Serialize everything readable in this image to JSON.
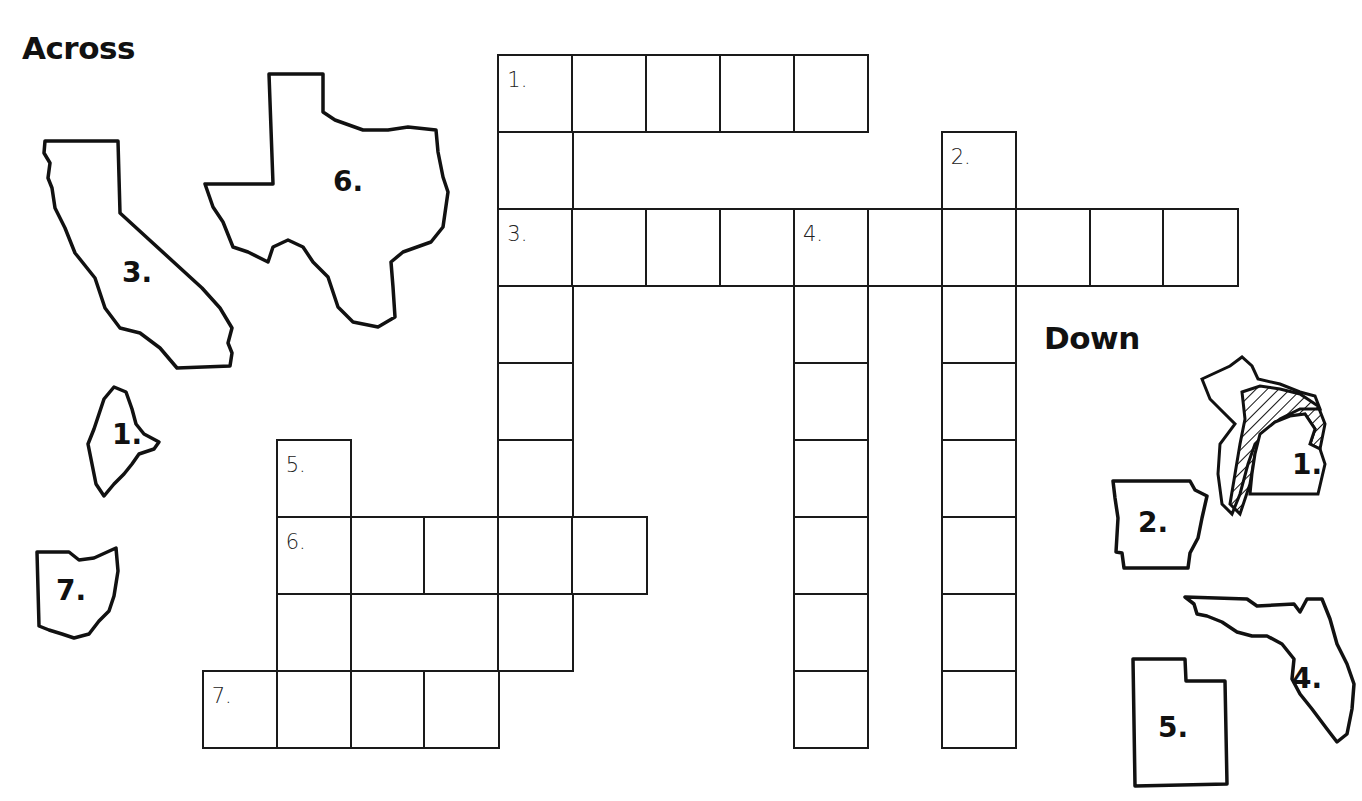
{
  "headings": {
    "across": "Across",
    "down": "Down"
  },
  "grid": {
    "origin_x": 203,
    "origin_y": 55,
    "cell_w": 73.9,
    "cell_h": 77.0,
    "cells": [
      [
        0,
        4,
        "1."
      ],
      [
        0,
        5,
        ""
      ],
      [
        0,
        6,
        ""
      ],
      [
        0,
        7,
        ""
      ],
      [
        0,
        8,
        ""
      ],
      [
        1,
        4,
        ""
      ],
      [
        1,
        10,
        "2."
      ],
      [
        2,
        4,
        "3."
      ],
      [
        2,
        5,
        ""
      ],
      [
        2,
        6,
        ""
      ],
      [
        2,
        7,
        ""
      ],
      [
        2,
        8,
        "4."
      ],
      [
        2,
        9,
        ""
      ],
      [
        2,
        10,
        ""
      ],
      [
        2,
        11,
        ""
      ],
      [
        2,
        12,
        ""
      ],
      [
        2,
        13,
        ""
      ],
      [
        3,
        4,
        ""
      ],
      [
        3,
        8,
        ""
      ],
      [
        3,
        10,
        ""
      ],
      [
        4,
        4,
        ""
      ],
      [
        4,
        8,
        ""
      ],
      [
        4,
        10,
        ""
      ],
      [
        5,
        1,
        "5."
      ],
      [
        5,
        4,
        ""
      ],
      [
        5,
        8,
        ""
      ],
      [
        5,
        10,
        ""
      ],
      [
        6,
        1,
        "6."
      ],
      [
        6,
        2,
        ""
      ],
      [
        6,
        3,
        ""
      ],
      [
        6,
        4,
        ""
      ],
      [
        6,
        5,
        ""
      ],
      [
        6,
        8,
        ""
      ],
      [
        6,
        10,
        ""
      ],
      [
        7,
        1,
        ""
      ],
      [
        7,
        4,
        ""
      ],
      [
        7,
        8,
        ""
      ],
      [
        7,
        10,
        ""
      ],
      [
        8,
        0,
        "7."
      ],
      [
        8,
        1,
        ""
      ],
      [
        8,
        2,
        ""
      ],
      [
        8,
        3,
        ""
      ],
      [
        8,
        8,
        ""
      ],
      [
        8,
        10,
        ""
      ]
    ]
  },
  "clues": {
    "across": [
      {
        "number": "1.",
        "state_icon": "maine-outline",
        "length": 5
      },
      {
        "number": "3.",
        "state_icon": "california-outline",
        "length": 10
      },
      {
        "number": "6.",
        "state_icon": "texas-outline",
        "length": 5
      },
      {
        "number": "7.",
        "state_icon": "ohio-outline",
        "length": 4
      }
    ],
    "down": [
      {
        "number": "1.",
        "state_icon": "michigan-outline",
        "length": 8
      },
      {
        "number": "2.",
        "state_icon": "arkansas-outline",
        "length": 8
      },
      {
        "number": "4.",
        "state_icon": "florida-outline",
        "length": 7
      },
      {
        "number": "5.",
        "state_icon": "utah-outline",
        "length": 4
      }
    ]
  },
  "state_labels": {
    "california": "3.",
    "texas": "6.",
    "maine": "1.",
    "ohio": "7.",
    "michigan": "1.",
    "arkansas": "2.",
    "florida": "4.",
    "utah": "5."
  }
}
